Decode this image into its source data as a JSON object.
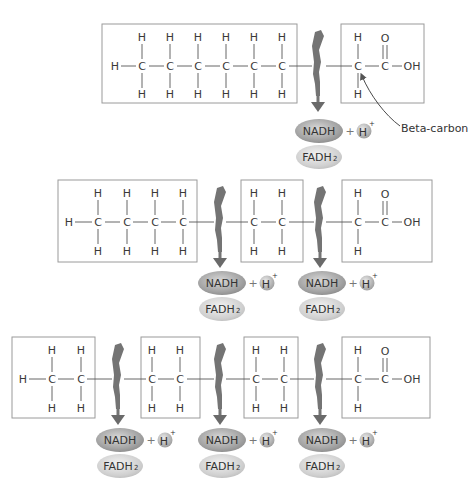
{
  "colors": {
    "box_stroke": "#9a9a9a",
    "bond": "#555555",
    "bolt": "#707070",
    "ellipse_dark": "#9c9c9c",
    "ellipse_light": "#d2d2d2"
  },
  "labels": {
    "nadh": "NADH",
    "fadh_main": "FADH",
    "fadh_sub": "2",
    "plus": "+",
    "h": "H",
    "h_sup": "+",
    "carbon": "C",
    "hydrogen": "H",
    "oxygen": "O",
    "hydroxyl": "OH",
    "beta_carbon": "Beta-carbon"
  },
  "rows": [
    {
      "name": "row-1",
      "backbone_y": 66,
      "boxes": [
        {
          "x": 102,
          "y": 24,
          "w": 195,
          "h": 79
        },
        {
          "x": 341,
          "y": 24,
          "w": 83,
          "h": 79
        }
      ],
      "cleavage_x": [
        319
      ],
      "annotation": "Beta-carbon"
    },
    {
      "name": "row-2",
      "backbone_y": 222,
      "boxes": [
        {
          "x": 58,
          "y": 180,
          "w": 139,
          "h": 82
        },
        {
          "x": 241,
          "y": 180,
          "w": 62,
          "h": 82
        },
        {
          "x": 342,
          "y": 180,
          "w": 90,
          "h": 82
        }
      ],
      "cleavage_x": [
        220,
        320
      ]
    },
    {
      "name": "row-3",
      "backbone_y": 379,
      "boxes": [
        {
          "x": 12,
          "y": 337,
          "w": 83,
          "h": 81
        },
        {
          "x": 141,
          "y": 337,
          "w": 59,
          "h": 81
        },
        {
          "x": 244,
          "y": 337,
          "w": 54,
          "h": 81
        },
        {
          "x": 342,
          "y": 337,
          "w": 88,
          "h": 81
        }
      ],
      "cleavage_x": [
        118,
        220,
        320
      ]
    }
  ]
}
